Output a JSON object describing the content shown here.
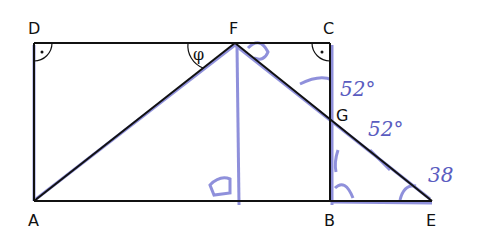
{
  "diagram": {
    "type": "geometry-sketch",
    "points": {
      "A": {
        "label": "A"
      },
      "B": {
        "label": "B"
      },
      "C": {
        "label": "C"
      },
      "D": {
        "label": "D"
      },
      "E": {
        "label": "E"
      },
      "F": {
        "label": "F"
      },
      "G": {
        "label": "G"
      }
    },
    "angle_label": "φ",
    "handwritten": {
      "angle_top": "52°",
      "angle_mid": "52°",
      "angle_e": "38"
    },
    "colors": {
      "ink": "#111111",
      "pen": "#5a5cc0"
    }
  }
}
